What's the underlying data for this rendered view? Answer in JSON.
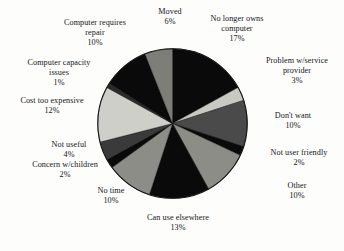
{
  "figure": {
    "background_color": "#fdfdfc",
    "text_color": "#15161a"
  },
  "chart_data": {
    "type": "pie",
    "title": "",
    "xlabel": "",
    "ylabel": "",
    "legend_position": "none",
    "grid": false,
    "labels_outside": true,
    "label_format": "name + percent",
    "start_angle_deg": 0,
    "direction": "clockwise",
    "categories": [
      "No longer owns computer",
      "Problem w/service provider",
      "Don't want",
      "Not user friendly",
      "Other",
      "Can use elsewhere",
      "No time",
      "Concern w/children",
      "Not useful",
      "Cost too expensive",
      "Computer capacity issues",
      "Computer requires repair",
      "Moved"
    ],
    "values": [
      17,
      3,
      10,
      2,
      10,
      13,
      10,
      2,
      4,
      12,
      1,
      10,
      6
    ],
    "value_labels": [
      "17%",
      "3%",
      "10%",
      "2%",
      "10%",
      "13%",
      "10%",
      "2%",
      "4%",
      "12%",
      "1%",
      "10%",
      "6%"
    ],
    "colors": [
      "#0a0a0a",
      "#c9c9c4",
      "#4a4a4a",
      "#0a0a0a",
      "#8d8d88",
      "#0a0a0a",
      "#8d8d88",
      "#0a0a0a",
      "#3a3a3a",
      "#cfcfca",
      "#2a2a2a",
      "#0a0a0a",
      "#7e7e79"
    ],
    "slices": [
      {
        "label": "No longer owns computer",
        "value": 17,
        "pct_text": "17%",
        "color": "#0a0a0a"
      },
      {
        "label": "Problem w/service provider",
        "value": 3,
        "pct_text": "3%",
        "color": "#c9c9c4"
      },
      {
        "label": "Don't want",
        "value": 10,
        "pct_text": "10%",
        "color": "#4a4a4a"
      },
      {
        "label": "Not user friendly",
        "value": 2,
        "pct_text": "2%",
        "color": "#0a0a0a"
      },
      {
        "label": "Other",
        "value": 10,
        "pct_text": "10%",
        "color": "#8d8d88"
      },
      {
        "label": "Can use elsewhere",
        "value": 13,
        "pct_text": "13%",
        "color": "#0a0a0a"
      },
      {
        "label": "No time",
        "value": 10,
        "pct_text": "10%",
        "color": "#8d8d88"
      },
      {
        "label": "Concern w/children",
        "value": 2,
        "pct_text": "2%",
        "color": "#0a0a0a"
      },
      {
        "label": "Not useful",
        "value": 4,
        "pct_text": "4%",
        "color": "#3a3a3a"
      },
      {
        "label": "Cost too expensive",
        "value": 12,
        "pct_text": "12%",
        "color": "#cfcfca"
      },
      {
        "label": "Computer capacity issues",
        "value": 1,
        "pct_text": "1%",
        "color": "#2a2a2a"
      },
      {
        "label": "Computer requires repair",
        "value": 10,
        "pct_text": "10%",
        "color": "#0a0a0a"
      },
      {
        "label": "Moved",
        "value": 6,
        "pct_text": "6%",
        "color": "#7e7e79"
      }
    ]
  },
  "callouts": {
    "moved": {
      "label": "Moved",
      "pct": "6%"
    },
    "no_longer": {
      "label": "No longer owns\ncomputer",
      "pct": "17%"
    },
    "problem": {
      "label": "Problem w/service\nprovider",
      "pct": "3%"
    },
    "dont_want": {
      "label": "Don't want",
      "pct": "10%"
    },
    "not_friendly": {
      "label": "Not user friendly",
      "pct": "2%"
    },
    "other": {
      "label": "Other",
      "pct": "10%"
    },
    "can_use": {
      "label": "Can use elsewhere",
      "pct": "13%"
    },
    "no_time": {
      "label": "No time",
      "pct": "10%"
    },
    "children": {
      "label": "Concern w/children",
      "pct": "2%"
    },
    "not_useful": {
      "label": "Not useful",
      "pct": "4%"
    },
    "cost": {
      "label": "Cost too expensive",
      "pct": "12%"
    },
    "capacity": {
      "label": "Computer capacity\nissues",
      "pct": "1%"
    },
    "repair": {
      "label": "Computer requires\nrepair",
      "pct": "10%"
    }
  }
}
